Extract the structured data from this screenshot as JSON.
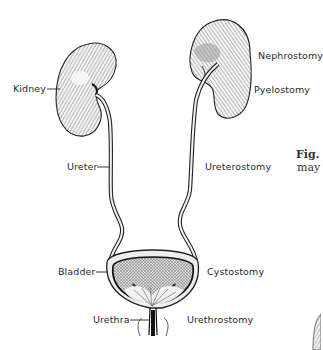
{
  "diagram": {
    "left_labels": [
      {
        "id": "kidney",
        "text": "Kidney"
      },
      {
        "id": "ureter",
        "text": "Ureter"
      },
      {
        "id": "bladder",
        "text": "Bladder"
      },
      {
        "id": "urethra",
        "text": "Urethra"
      }
    ],
    "right_labels": [
      {
        "id": "nephrostomy",
        "text": "Nephrostomy"
      },
      {
        "id": "pyelostomy",
        "text": "Pyelostomy"
      },
      {
        "id": "ureterostomy",
        "text": "Ureterostomy"
      },
      {
        "id": "cystostomy",
        "text": "Cystostomy"
      },
      {
        "id": "urethrostomy",
        "text": "Urethrostomy"
      }
    ],
    "caption_fragment": {
      "line1": "Fig.",
      "line2": "may"
    }
  }
}
